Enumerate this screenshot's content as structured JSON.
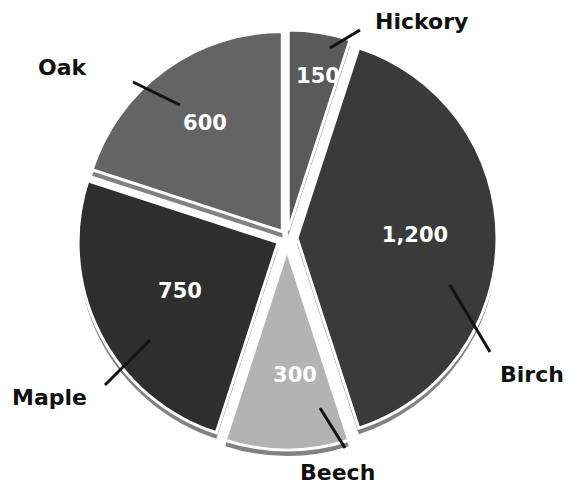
{
  "chart_data": {
    "type": "pie",
    "title": "",
    "exploded": true,
    "categories": [
      "Hickory",
      "Birch",
      "Beech",
      "Maple",
      "Oak"
    ],
    "values": [
      150,
      1200,
      300,
      750,
      600
    ],
    "value_labels": [
      "150",
      "1,200",
      "300",
      "750",
      "600"
    ],
    "colors": [
      "#5a5a5a",
      "#3a3a3a",
      "#b3b3b3",
      "#2e2e2e",
      "#646464"
    ],
    "start_angle_deg": 0,
    "direction": "clockwise",
    "legend": "none",
    "labels": "callout lines with category names outside, values inside slices"
  },
  "slices": [
    {
      "name": "Hickory",
      "value_label": "150"
    },
    {
      "name": "Birch",
      "value_label": "1,200"
    },
    {
      "name": "Beech",
      "value_label": "300"
    },
    {
      "name": "Maple",
      "value_label": "750"
    },
    {
      "name": "Oak",
      "value_label": "600"
    }
  ]
}
